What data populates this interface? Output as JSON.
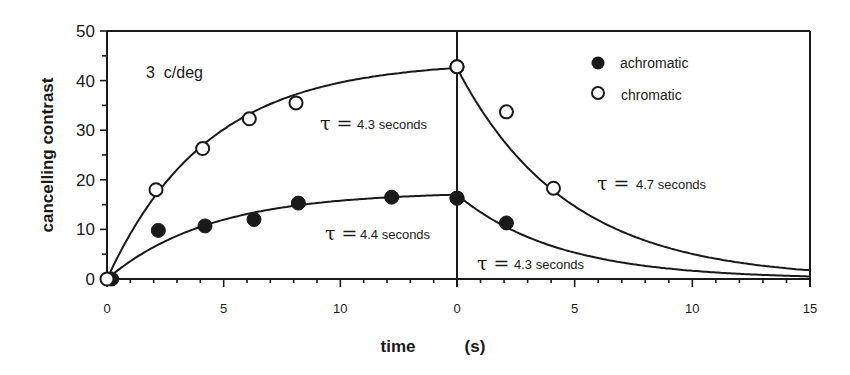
{
  "chart_data": {
    "type": "scatter",
    "title": "",
    "annotation": "3  c/deg",
    "xlabel": "time    (s)",
    "ylabel": "cancelling contrast",
    "ylim": [
      0,
      50
    ],
    "yticks": [
      "0",
      "10",
      "20",
      "30",
      "40",
      "50"
    ],
    "panels": [
      {
        "name": "adaptation",
        "xlim": [
          0,
          15
        ],
        "xticks": [
          "0",
          "5",
          "10"
        ]
      },
      {
        "name": "recovery",
        "xlim": [
          0,
          15
        ],
        "xticks": [
          "0",
          "5",
          "10",
          "15"
        ]
      }
    ],
    "legend": {
      "position": "upper right",
      "entries": [
        {
          "label": "achromatic",
          "marker": "filled-circle"
        },
        {
          "label": "chromatic",
          "marker": "open-circle"
        }
      ]
    },
    "series": [
      {
        "name": "chromatic",
        "marker": "open-circle",
        "panel": "adaptation",
        "x": [
          0,
          2.1,
          4.1,
          6.1,
          8.1,
          15
        ],
        "y": [
          0,
          18,
          26.3,
          32.3,
          35.5,
          42.8
        ],
        "fit": {
          "type": "exp-rise",
          "tau": 4.3,
          "asymptote": 43.9
        }
      },
      {
        "name": "achromatic",
        "marker": "filled-circle",
        "panel": "adaptation",
        "x": [
          0.2,
          2.2,
          4.2,
          6.3,
          8.2,
          12.2,
          15
        ],
        "y": [
          0,
          9.8,
          10.7,
          12,
          15.3,
          16.5,
          16.3
        ],
        "fit": {
          "type": "exp-rise",
          "tau": 4.4,
          "asymptote": 17.6
        }
      },
      {
        "name": "chromatic",
        "marker": "open-circle",
        "panel": "recovery",
        "x": [
          0,
          2.1,
          4.1
        ],
        "y": [
          42.8,
          33.7,
          18.3
        ],
        "fit": {
          "type": "exp-decay",
          "tau": 4.7,
          "start": 42.5
        }
      },
      {
        "name": "achromatic",
        "marker": "filled-circle",
        "panel": "recovery",
        "x": [
          0,
          2.1
        ],
        "y": [
          16.3,
          11.3
        ],
        "fit": {
          "type": "exp-decay",
          "tau": 4.3,
          "start": 17
        }
      }
    ],
    "tau_annotations": [
      {
        "symbol": "τ =",
        "value": "4.3 seconds",
        "series": "chromatic",
        "panel": "adaptation"
      },
      {
        "symbol": "τ =",
        "value": "4.4 seconds",
        "series": "achromatic",
        "panel": "adaptation"
      },
      {
        "symbol": "τ =",
        "value": "4.7 seconds",
        "series": "chromatic",
        "panel": "recovery"
      },
      {
        "symbol": "τ =",
        "value": "4.3 seconds",
        "series": "achromatic",
        "panel": "recovery"
      }
    ],
    "grid": false
  },
  "labels": {
    "ylabel": "cancelling contrast",
    "xlabel_main": "time",
    "xlabel_unit": "(s)",
    "annotation": "3  c/deg",
    "legend_achromatic": "achromatic",
    "legend_chromatic": "chromatic",
    "tau_symbol": "τ =",
    "tau1": "4.3 seconds",
    "tau2": "4.4 seconds",
    "tau3": "4.7 seconds",
    "tau4": "4.3 seconds"
  },
  "colors": {
    "ink": "#1a1a1a",
    "background": "#ffffff"
  }
}
